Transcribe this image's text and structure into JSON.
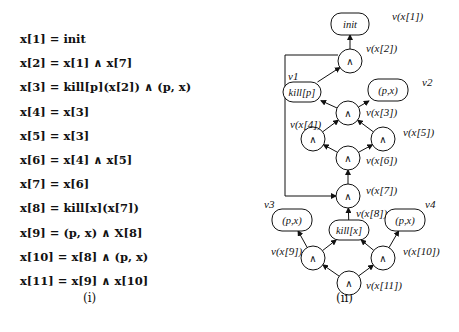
{
  "equations": [
    "x[1] = init",
    "x[2] = x[1] ∧ x[7]",
    "x[3] = kill[p](x[2]) ∧ (p, x)",
    "x[4] = x[3]",
    "x[5] = x[3]",
    "x[6] = x[4] ∧ x[5]",
    "x[7] = x[6]",
    "x[8] = kill[x](x[7])",
    "x[9] = (p, x) ∧ X[8]",
    "x[10] = x[8] ∧ (p, x)",
    "x[11] = x[9] ∧ x[10]"
  ],
  "captions": {
    "left": "(i)",
    "right": "(ii)"
  },
  "graph": {
    "nodes": [
      {
        "id": "x1",
        "shape": "rounded",
        "text": "init",
        "label": "v(x[1])"
      },
      {
        "id": "x2",
        "shape": "circle",
        "text": "∧",
        "label": "v(x[2])"
      },
      {
        "id": "v1",
        "shape": "rounded",
        "text": "kill[p]",
        "label": "v1"
      },
      {
        "id": "v2",
        "shape": "rounded",
        "text": "(p,x)",
        "label": "v2"
      },
      {
        "id": "x3",
        "shape": "circle",
        "text": "∧",
        "label": "v(x[3])"
      },
      {
        "id": "x4",
        "shape": "circle",
        "text": "∧",
        "label": "v(x[4])"
      },
      {
        "id": "x5",
        "shape": "circle",
        "text": "∧",
        "label": "v(x[5])"
      },
      {
        "id": "x6",
        "shape": "circle",
        "text": "∧",
        "label": "v(x[6])"
      },
      {
        "id": "x7",
        "shape": "circle",
        "text": "∧",
        "label": "v(x[7])"
      },
      {
        "id": "v3",
        "shape": "rounded",
        "text": "(p,x)",
        "label": "v3"
      },
      {
        "id": "x8",
        "shape": "rounded",
        "text": "kill[x]",
        "label": "v(x[8])"
      },
      {
        "id": "v4",
        "shape": "rounded",
        "text": "(p,x)",
        "label": "v4"
      },
      {
        "id": "x9",
        "shape": "circle",
        "text": "∧",
        "label": "v(x[9])"
      },
      {
        "id": "x10",
        "shape": "circle",
        "text": "∧",
        "label": "v(x[10])"
      },
      {
        "id": "x11",
        "shape": "circle",
        "text": "∧",
        "label": "v(x[11])"
      }
    ],
    "edges": [
      [
        "x2",
        "x1"
      ],
      [
        "x3",
        "v1"
      ],
      [
        "x3",
        "v2"
      ],
      [
        "v1",
        "x2"
      ],
      [
        "x4",
        "x3"
      ],
      [
        "x5",
        "x3"
      ],
      [
        "x6",
        "x4"
      ],
      [
        "x6",
        "x5"
      ],
      [
        "x7",
        "x6"
      ],
      [
        "x8",
        "x7"
      ],
      [
        "x9",
        "v3"
      ],
      [
        "x9",
        "x8"
      ],
      [
        "x10",
        "x8"
      ],
      [
        "x10",
        "v4"
      ],
      [
        "x11",
        "x9"
      ],
      [
        "x11",
        "x10"
      ],
      [
        "x2",
        "x7",
        "feedback"
      ]
    ]
  }
}
